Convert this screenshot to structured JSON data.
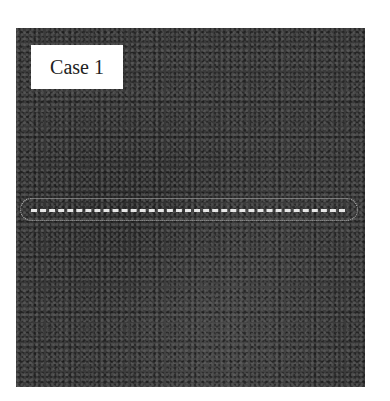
{
  "figure": {
    "label": "Case 1",
    "colors": {
      "background": "#3a3a3a",
      "label_box": "#ffffff",
      "dashed_line": "#e6e6e6",
      "ellipse": "#b8b8b8"
    },
    "annotation": {
      "type": "dashed-line-in-ellipse",
      "orientation": "horizontal"
    }
  }
}
